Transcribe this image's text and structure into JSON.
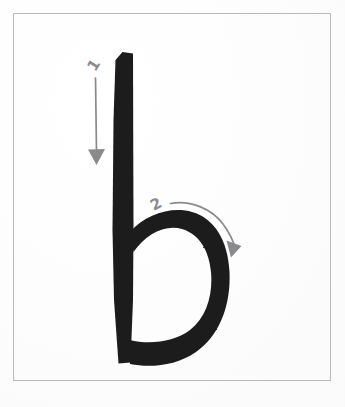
{
  "document": {
    "kind": "handwriting-stroke-order-diagram",
    "subject_letter": "b",
    "letter_case": "lowercase",
    "description": "Lowercase letter b with numbered stroke-order arrows"
  },
  "frame": {
    "border_color": "#b9b9bb",
    "background_color": "#fefefe"
  },
  "palette": {
    "letter_ink": "#1c1c1c",
    "arrow_gray": "#8a8a8c",
    "number_gray": "#8a8a8c",
    "paper_white": "#fefefe",
    "border_gray": "#b9b9bb"
  },
  "letter": {
    "glyph": "b",
    "ink_color": "#1c1c1c",
    "stem_label": "vertical-stem",
    "bowl_label": "lower-bowl"
  },
  "strokes": [
    {
      "order": "1",
      "number_label": "1",
      "name": "stroke-1-downstroke",
      "direction": "top-to-bottom",
      "arrow_type": "straight",
      "color": "#8a8a8c",
      "number_rotation_deg": -58
    },
    {
      "order": "2",
      "number_label": "2",
      "name": "stroke-2-bowl-curve",
      "direction": "left-to-right-clockwise-arc",
      "arrow_type": "curved",
      "color": "#8a8a8c",
      "number_rotation_deg": -28
    }
  ]
}
